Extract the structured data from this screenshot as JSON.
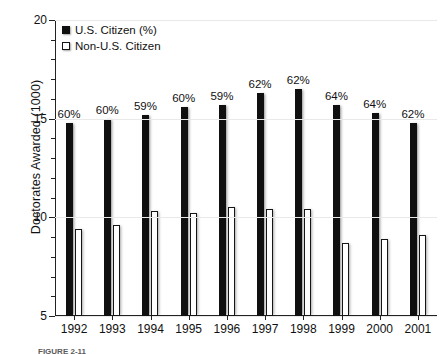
{
  "chart_data": {
    "type": "bar",
    "title": "",
    "xlabel": "",
    "ylabel": "Doctorates Awarded (1000)",
    "ylim": [
      5,
      20
    ],
    "yticks": [
      5,
      10,
      15,
      20
    ],
    "yticklabels": [
      "5",
      "10",
      "15",
      "20"
    ],
    "minor_ticks_per_interval": 5,
    "grid": true,
    "legend_position": "upper-left",
    "categories": [
      "1992",
      "1993",
      "1994",
      "1995",
      "1996",
      "1997",
      "1998",
      "1999",
      "2000",
      "2001"
    ],
    "series": [
      {
        "name": "U.S. Citizen (%)",
        "color": "#101010",
        "values": [
          14.8,
          15.0,
          15.2,
          15.6,
          15.7,
          16.3,
          16.5,
          15.7,
          15.3,
          14.8
        ],
        "data_labels": [
          "60%",
          "60%",
          "59%",
          "60%",
          "59%",
          "62%",
          "62%",
          "64%",
          "64%",
          "62%"
        ]
      },
      {
        "name": "Non-U.S. Citizen",
        "color": "#ffffff",
        "values": [
          9.4,
          9.6,
          10.3,
          10.2,
          10.5,
          10.4,
          10.4,
          8.7,
          8.9,
          9.1
        ],
        "data_labels": [
          "",
          "",
          "",
          "",
          "",
          "",
          "",
          "",
          "",
          ""
        ]
      }
    ]
  },
  "legend": {
    "items": [
      {
        "label": "U.S. Citizen (%)",
        "swatch": "dark"
      },
      {
        "label": "Non-U.S. Citizen",
        "swatch": "light"
      }
    ]
  },
  "caption": {
    "text": "FIGURE 2-11"
  }
}
